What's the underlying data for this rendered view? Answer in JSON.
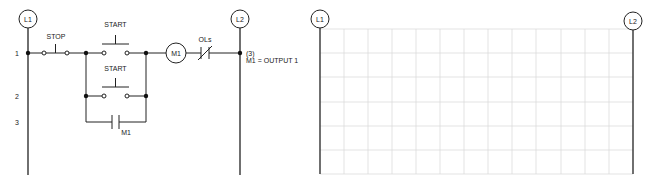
{
  "left_diagram": {
    "rail_left_label": "L1",
    "rail_right_label": "L2",
    "rung_numbers": [
      "1",
      "2",
      "3"
    ],
    "stop_label": "STOP",
    "start_label_1": "START",
    "start_label_2": "START",
    "coil_label": "M1",
    "overload_label": "OLs",
    "seal_contact_label": "M1",
    "output_ref": "(3)",
    "output_assignment": "M1 = OUTPUT 1"
  },
  "right_diagram": {
    "rail_left_label": "L1",
    "rail_right_label": "L2",
    "grid": {
      "columns": 13,
      "rows": 6
    }
  }
}
